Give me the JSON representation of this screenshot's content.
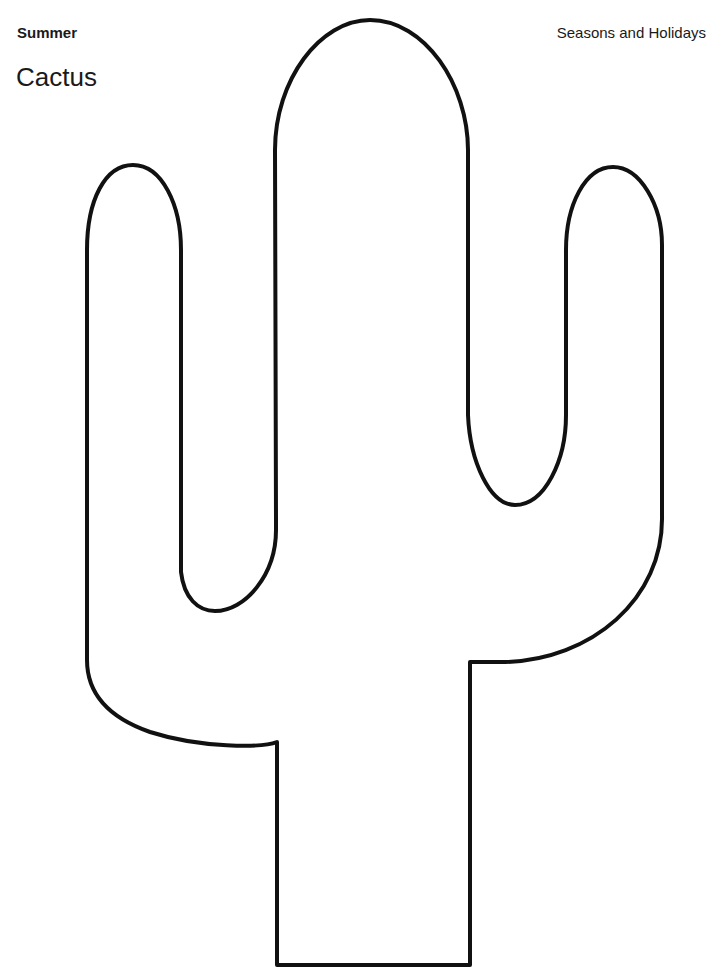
{
  "header": {
    "category": "Summer",
    "title": "Cactus",
    "series": "Seasons and Holidays"
  },
  "figure": {
    "shape": "cactus-outline",
    "stroke_color": "#111111",
    "fill_color": "#ffffff"
  }
}
